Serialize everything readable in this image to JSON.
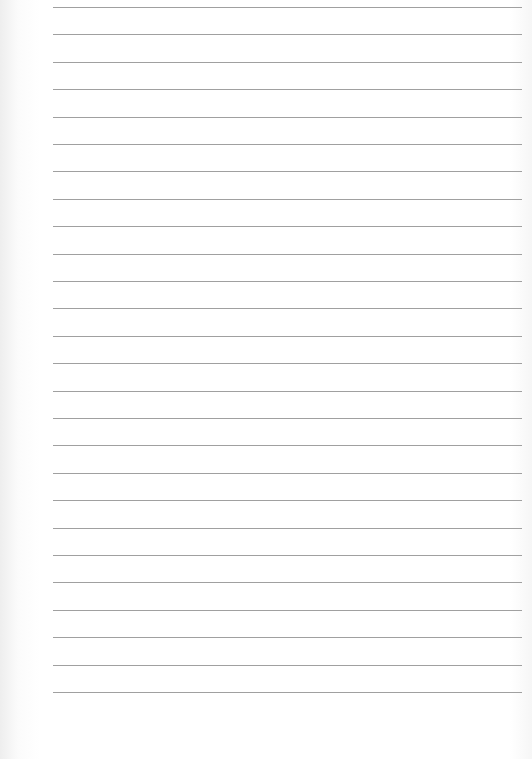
{
  "page": {
    "type": "lined-paper",
    "background_color": "#ffffff",
    "line_color": "#8f8f8f",
    "line_count": 26,
    "line_left": 53,
    "line_right": 522,
    "first_line_y": 7,
    "line_spacing": 27.4
  }
}
